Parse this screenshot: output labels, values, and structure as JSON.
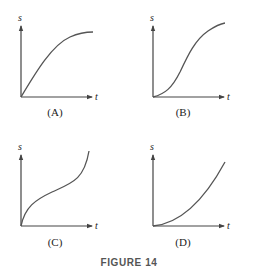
{
  "figure": {
    "caption": "FIGURE 14",
    "panels": [
      {
        "id": "A",
        "label": "(A)",
        "x_axis": "t",
        "y_axis": "s",
        "shape": "concave down, increasing from origin and leveling off"
      },
      {
        "id": "B",
        "label": "(B)",
        "x_axis": "t",
        "y_axis": "s",
        "shape": "S-shaped: concave up then concave down"
      },
      {
        "id": "C",
        "label": "(C)",
        "x_axis": "t",
        "y_axis": "s",
        "shape": "concave down then concave up"
      },
      {
        "id": "D",
        "label": "(D)",
        "x_axis": "t",
        "y_axis": "s",
        "shape": "concave up, increasing from origin"
      }
    ]
  },
  "colors": {
    "axis": "#444444",
    "curve": "#555555",
    "caption": "#555555"
  }
}
